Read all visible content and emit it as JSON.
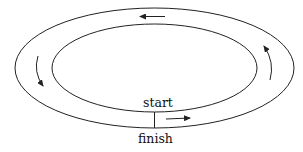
{
  "diagram": {
    "labels": {
      "start": "start",
      "finish": "finish"
    },
    "track": {
      "outer": {
        "cx": 154.5,
        "cy": 68,
        "rx": 139.5,
        "ry": 60
      },
      "inner": {
        "cx": 154.5,
        "cy": 68,
        "rx": 102.5,
        "ry": 44
      }
    },
    "arrows": [
      "top-left",
      "left-down",
      "right-up",
      "bottom-right"
    ],
    "colors": {
      "stroke": "#222222",
      "background": "#ffffff"
    }
  }
}
